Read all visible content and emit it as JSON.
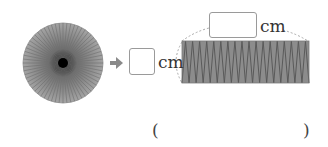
{
  "figure": {
    "circle": {
      "sectors": 64,
      "fill": "#9a9a9a",
      "line": "#6e6e6e",
      "center": "#000000"
    },
    "arrow": {
      "color": "#8a8a8a"
    },
    "rectangle": {
      "strips": 36,
      "fill": "#8c8c8c",
      "line": "#5a5a5a"
    }
  },
  "labels": {
    "height_unit": "cm",
    "width_unit": "cm"
  },
  "inputs": {
    "height_value": "",
    "width_value": "",
    "answer_value": ""
  },
  "answer": {
    "open_paren": "(",
    "close_paren": ")"
  }
}
